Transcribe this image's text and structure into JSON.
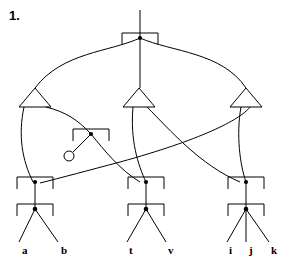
{
  "figure": {
    "number_label": "1.",
    "caption": ""
  },
  "diagram": {
    "type": "syntax-tree-movement-diagram",
    "width": 300,
    "height": 264,
    "stroke_color": "#000000",
    "background_color": "#ffffff",
    "leaf_labels": [
      {
        "id": "leaf-a",
        "text": "a",
        "x": 22,
        "y": 252
      },
      {
        "id": "leaf-b",
        "text": "b",
        "x": 61,
        "y": 252
      },
      {
        "id": "leaf-t",
        "text": "t",
        "x": 128,
        "y": 252
      },
      {
        "id": "leaf-v",
        "text": "v",
        "x": 163,
        "y": 252
      },
      {
        "id": "leaf-i",
        "text": "i",
        "x": 230,
        "y": 252
      },
      {
        "id": "leaf-j",
        "text": "j",
        "x": 249,
        "y": 252
      },
      {
        "id": "leaf-k",
        "text": "k",
        "x": 272,
        "y": 252
      }
    ],
    "nodes": {
      "root_bracket": {
        "cx": 140,
        "cy": 38,
        "half_width": 18
      },
      "triangles": [
        {
          "id": "triangle-left",
          "cx": 35,
          "apex_y": 88,
          "base_y": 107,
          "half_width": 16
        },
        {
          "id": "triangle-middle",
          "cx": 139,
          "apex_y": 88,
          "base_y": 107,
          "half_width": 16
        },
        {
          "id": "triangle-right",
          "cx": 246,
          "apex_y": 88,
          "base_y": 107,
          "half_width": 16
        }
      ],
      "floating_bracket": {
        "cx": 91,
        "cy": 134,
        "half_width": 18
      },
      "open_circle": {
        "cx": 69,
        "cy": 155,
        "r": 5
      },
      "lower_brackets": [
        {
          "id": "bracket-left-upper",
          "cx": 35,
          "cy": 182,
          "half_width": 18
        },
        {
          "id": "bracket-left-lower",
          "cx": 35,
          "cy": 209,
          "half_width": 18
        },
        {
          "id": "bracket-mid-upper",
          "cx": 146,
          "cy": 182,
          "half_width": 18
        },
        {
          "id": "bracket-mid-lower",
          "cx": 146,
          "cy": 209,
          "half_width": 18
        },
        {
          "id": "bracket-right-upper",
          "cx": 246,
          "cy": 182,
          "half_width": 18
        },
        {
          "id": "bracket-right-lower",
          "cx": 246,
          "cy": 209,
          "half_width": 18
        }
      ]
    }
  }
}
